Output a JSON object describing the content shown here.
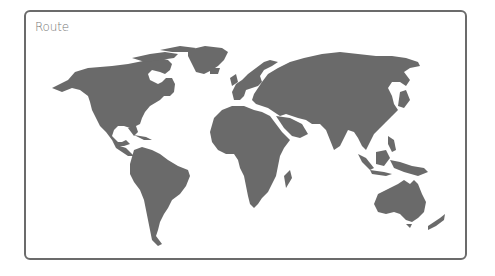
{
  "card": {
    "title": "Route"
  },
  "map": {
    "land_color": "#6a6a6a",
    "border_color": "#6b6b6b",
    "regions": [
      "north-america",
      "greenland",
      "south-america",
      "europe",
      "africa",
      "asia",
      "southeast-asia",
      "australia",
      "new-zealand"
    ]
  }
}
